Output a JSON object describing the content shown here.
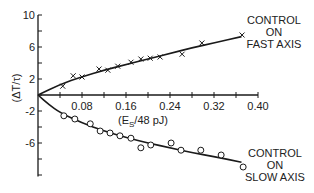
{
  "chart_data": {
    "type": "scatter",
    "title": "",
    "xlabel": "(E_S/48 pJ)",
    "ylabel": "(ΔT/τ)",
    "xlim": [
      0,
      0.4
    ],
    "ylim": [
      -10,
      10
    ],
    "x_ticks": [
      0,
      0.04,
      0.08,
      0.12,
      0.16,
      0.2,
      0.24,
      0.28,
      0.32,
      0.36,
      0.4
    ],
    "x_tick_labels": [
      "0.08",
      "0.16",
      "0.24",
      "0.32",
      "0.40"
    ],
    "y_ticks": [
      10,
      8,
      6,
      4,
      2,
      0,
      -2,
      -4,
      -6,
      -8,
      -10
    ],
    "y_tick_labels": [
      "10",
      "6",
      "2",
      "-2",
      "-6"
    ],
    "grid": false,
    "series": [
      {
        "name": "Control on fast axis",
        "marker": "x",
        "points": [
          [
            0.045,
            1.1
          ],
          [
            0.064,
            2.4
          ],
          [
            0.08,
            2.25
          ],
          [
            0.111,
            3.25
          ],
          [
            0.127,
            3.1
          ],
          [
            0.145,
            3.6
          ],
          [
            0.169,
            4.1
          ],
          [
            0.187,
            4.5
          ],
          [
            0.204,
            4.6
          ],
          [
            0.222,
            4.75
          ],
          [
            0.262,
            5.1
          ],
          [
            0.298,
            6.5
          ],
          [
            0.371,
            7.5
          ]
        ],
        "fit_curve": [
          [
            0,
            0
          ],
          [
            0.04,
            1.3
          ],
          [
            0.08,
            2.3
          ],
          [
            0.12,
            3.1
          ],
          [
            0.16,
            3.8
          ],
          [
            0.2,
            4.5
          ],
          [
            0.24,
            5.2
          ],
          [
            0.28,
            5.9
          ],
          [
            0.32,
            6.5
          ],
          [
            0.37,
            7.3
          ]
        ]
      },
      {
        "name": "Control on slow axis",
        "marker": "o",
        "points": [
          [
            0.047,
            -2.6
          ],
          [
            0.067,
            -3.0
          ],
          [
            0.095,
            -3.6
          ],
          [
            0.113,
            -4.5
          ],
          [
            0.131,
            -4.75
          ],
          [
            0.149,
            -5.1
          ],
          [
            0.169,
            -5.4
          ],
          [
            0.187,
            -6.6
          ],
          [
            0.205,
            -6.25
          ],
          [
            0.242,
            -6.0
          ],
          [
            0.26,
            -6.9
          ],
          [
            0.296,
            -6.9
          ],
          [
            0.333,
            -7.5
          ],
          [
            0.373,
            -9.0
          ]
        ],
        "fit_curve": [
          [
            0,
            0
          ],
          [
            0.02,
            -1.2
          ],
          [
            0.04,
            -2.2
          ],
          [
            0.08,
            -3.5
          ],
          [
            0.12,
            -4.5
          ],
          [
            0.16,
            -5.3
          ],
          [
            0.2,
            -6.0
          ],
          [
            0.24,
            -6.6
          ],
          [
            0.28,
            -7.2
          ],
          [
            0.32,
            -7.7
          ],
          [
            0.37,
            -8.4
          ]
        ]
      }
    ],
    "annotations": [
      {
        "text": [
          "CONTROL",
          "ON",
          "FAST AXIS"
        ],
        "near_series": "Control on fast axis"
      },
      {
        "text": [
          "CONTROL",
          "ON",
          "SLOW AXIS"
        ],
        "near_series": "Control on slow axis"
      }
    ]
  },
  "labels": {
    "xlabel_main": "(E",
    "xlabel_sub": "S",
    "xlabel_rest": "/48 pJ)",
    "ylabel": "(ΔT/τ)",
    "fast": [
      "CONTROL",
      "ON",
      "FAST AXIS"
    ],
    "slow": [
      "CONTROL",
      "ON",
      "SLOW AXIS"
    ]
  }
}
